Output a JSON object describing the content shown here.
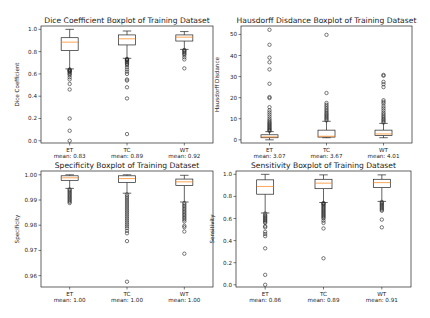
{
  "figure": {
    "background": "#ffffff",
    "line_color": "#222222",
    "median_color": "#ff7f0e"
  },
  "chart_data": [
    {
      "type": "box",
      "id": "dice",
      "title": "Dice Coefficient Boxplot of Training Dataset",
      "ylabel": "Dice Coefficient",
      "categories": [
        "ET",
        "TC",
        "WT"
      ],
      "means_text": [
        "mean: 0.83",
        "mean: 0.89",
        "mean: 0.92"
      ],
      "ylim": [
        -0.02,
        1.03
      ],
      "yticks": [
        0.0,
        0.2,
        0.4,
        0.6,
        0.8,
        1.0
      ],
      "ytick_labels": [
        "0.0",
        "0.2",
        "0.4",
        "0.6",
        "0.8",
        "1.0"
      ],
      "frame": {
        "x0": 41,
        "x1": 213,
        "y0": 26,
        "y1": 143
      },
      "series": [
        {
          "name": "ET",
          "whisker_low": 0.645,
          "q1": 0.81,
          "median": 0.885,
          "q3": 0.925,
          "whisker_high": 1.0,
          "outliers": [
            0.64,
            0.635,
            0.63,
            0.625,
            0.62,
            0.61,
            0.6,
            0.59,
            0.57,
            0.55,
            0.51,
            0.46,
            0.2,
            0.09,
            0.0
          ]
        },
        {
          "name": "TC",
          "whisker_low": 0.74,
          "q1": 0.86,
          "median": 0.915,
          "q3": 0.95,
          "whisker_high": 0.985,
          "outliers": [
            0.735,
            0.73,
            0.725,
            0.72,
            0.71,
            0.7,
            0.69,
            0.68,
            0.66,
            0.64,
            0.62,
            0.6,
            0.55,
            0.54,
            0.48,
            0.38,
            0.06
          ]
        },
        {
          "name": "WT",
          "whisker_low": 0.82,
          "q1": 0.895,
          "median": 0.93,
          "q3": 0.95,
          "whisker_high": 0.98,
          "outliers": [
            0.815,
            0.81,
            0.8,
            0.79,
            0.78,
            0.77,
            0.75,
            0.73,
            0.65
          ]
        }
      ]
    },
    {
      "type": "box",
      "id": "hausdorff",
      "title": "Hausdorff Disdance Boxplot of Training Dataset",
      "ylabel": "Hausdorff Disdance",
      "categories": [
        "ET",
        "TC",
        "WT"
      ],
      "means_text": [
        "mean: 3.07",
        "mean: 3.67",
        "mean: 4.01"
      ],
      "ylim": [
        -1.5,
        54
      ],
      "yticks": [
        0,
        10,
        20,
        30,
        40,
        50
      ],
      "ytick_labels": [
        "0",
        "10",
        "20",
        "30",
        "40",
        "50"
      ],
      "frame": {
        "x0": 241,
        "x1": 412,
        "y0": 26,
        "y1": 143
      },
      "series": [
        {
          "name": "ET",
          "whisker_low": 0.0,
          "q1": 1.0,
          "median": 1.4,
          "q3": 2.4,
          "whisker_high": 3.9,
          "outliers": [
            4.2,
            4.6,
            5.0,
            5.5,
            6.0,
            6.5,
            7.0,
            7.5,
            8.0,
            8.6,
            9.2,
            10.0,
            11.0,
            12.0,
            13.0,
            14.0,
            15.5,
            19.8,
            20.3,
            26.6,
            33.4,
            36.8,
            39.0,
            45.1,
            52.2
          ]
        },
        {
          "name": "TC",
          "whisker_low": 1.0,
          "q1": 1.3,
          "median": 1.7,
          "q3": 4.6,
          "whisker_high": 8.8,
          "outliers": [
            9.2,
            9.8,
            10.4,
            11.0,
            11.6,
            12.2,
            12.8,
            13.5,
            14.2,
            15.0,
            15.8,
            16.6,
            17.5,
            22.2,
            49.8
          ]
        },
        {
          "name": "WT",
          "whisker_low": 1.0,
          "q1": 2.1,
          "median": 2.8,
          "q3": 4.6,
          "whisker_high": 7.8,
          "outliers": [
            8.2,
            8.8,
            9.4,
            10.0,
            10.7,
            11.4,
            12.2,
            13.0,
            14.0,
            15.0,
            16.0,
            17.2,
            18.0,
            18.8,
            25.0,
            26.4,
            27.5,
            30.4,
            30.8
          ]
        }
      ]
    },
    {
      "type": "box",
      "id": "specificity",
      "title": "Specificity Boxplot of Training Dataset",
      "ylabel": "Specificity",
      "categories": [
        "ET",
        "TC",
        "WT"
      ],
      "means_text": [
        "mean: 1.00",
        "mean: 1.00",
        "mean: 1.00"
      ],
      "ylim": [
        0.9555,
        1.0015
      ],
      "yticks": [
        0.96,
        0.97,
        0.98,
        0.99,
        1.0
      ],
      "ytick_labels": [
        "0.96",
        "0.97",
        "0.98",
        "0.99",
        "1.00"
      ],
      "frame": {
        "x0": 41,
        "x1": 213,
        "y0": 171,
        "y1": 287
      },
      "series": [
        {
          "name": "ET",
          "whisker_low": 0.9946,
          "q1": 0.9978,
          "median": 0.9988,
          "q3": 0.9996,
          "whisker_high": 1.0,
          "outliers": [
            0.9942,
            0.9938,
            0.9933,
            0.9928,
            0.9923,
            0.9918,
            0.9913,
            0.9908,
            0.9903,
            0.9898,
            0.9893,
            0.9888
          ]
        },
        {
          "name": "TC",
          "whisker_low": 0.9927,
          "q1": 0.997,
          "median": 0.9985,
          "q3": 0.9996,
          "whisker_high": 1.0,
          "outliers": [
            0.9922,
            0.9915,
            0.9908,
            0.99,
            0.9892,
            0.9884,
            0.9876,
            0.9868,
            0.986,
            0.9852,
            0.9844,
            0.9836,
            0.9828,
            0.982,
            0.9812,
            0.9804,
            0.9796,
            0.9788,
            0.9778,
            0.9768,
            0.9737,
            0.9576
          ]
        },
        {
          "name": "WT",
          "whisker_low": 0.9892,
          "q1": 0.9957,
          "median": 0.9972,
          "q3": 0.9983,
          "whisker_high": 0.9998,
          "outliers": [
            0.9888,
            0.9882,
            0.9876,
            0.987,
            0.9864,
            0.9858,
            0.9852,
            0.9846,
            0.984,
            0.9834,
            0.9828,
            0.9822,
            0.9815,
            0.9798,
            0.9792,
            0.9775,
            0.9687
          ]
        }
      ]
    },
    {
      "type": "box",
      "id": "sensitivity",
      "title": "Sensitivity Boxplot of Training Dataset",
      "ylabel": "Sensitivity",
      "categories": [
        "ET",
        "TC",
        "WT"
      ],
      "means_text": [
        "mean: 0.86",
        "mean: 0.89",
        "mean: 0.91"
      ],
      "ylim": [
        -0.02,
        1.03
      ],
      "yticks": [
        0.0,
        0.2,
        0.4,
        0.6,
        0.8,
        1.0
      ],
      "ytick_labels": [
        "0.0",
        "0.2",
        "0.4",
        "0.6",
        "0.8",
        "1.0"
      ],
      "frame": {
        "x0": 236,
        "x1": 411,
        "y0": 171,
        "y1": 287
      },
      "series": [
        {
          "name": "ET",
          "whisker_low": 0.65,
          "q1": 0.82,
          "median": 0.89,
          "q3": 0.95,
          "whisker_high": 1.0,
          "outliers": [
            0.645,
            0.63,
            0.62,
            0.61,
            0.6,
            0.59,
            0.58,
            0.57,
            0.56,
            0.53,
            0.52,
            0.48,
            0.46,
            0.44,
            0.33,
            0.09,
            0.0
          ]
        },
        {
          "name": "TC",
          "whisker_low": 0.745,
          "q1": 0.87,
          "median": 0.92,
          "q3": 0.955,
          "whisker_high": 0.995,
          "outliers": [
            0.74,
            0.735,
            0.73,
            0.72,
            0.71,
            0.7,
            0.69,
            0.68,
            0.67,
            0.66,
            0.65,
            0.64,
            0.63,
            0.62,
            0.61,
            0.6,
            0.58,
            0.56,
            0.51,
            0.24
          ]
        },
        {
          "name": "WT",
          "whisker_low": 0.755,
          "q1": 0.88,
          "median": 0.925,
          "q3": 0.955,
          "whisker_high": 0.995,
          "outliers": [
            0.75,
            0.74,
            0.73,
            0.72,
            0.71,
            0.7,
            0.69,
            0.68,
            0.67,
            0.59,
            0.52
          ]
        }
      ]
    }
  ]
}
